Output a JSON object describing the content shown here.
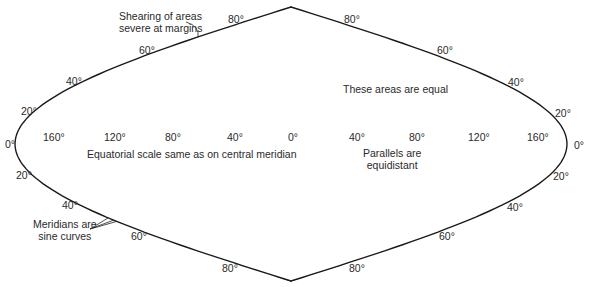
{
  "figure": {
    "projection": {
      "center_x": 291,
      "equator_y": 144,
      "half_width": 276,
      "half_height": 137
    },
    "colors": {
      "outline": "#1a1a1a",
      "grid": "#3a3a3a",
      "land": "#b4b4b4",
      "highlight_band": "#6e6e6e",
      "background": "#ffffff"
    }
  },
  "annotations": {
    "shearing_line1": "Shearing of areas",
    "shearing_line2": "severe at margins",
    "equal_areas": "These areas are equal",
    "equatorial_scale": "Equatorial scale same as on central meridian",
    "parallels_line1": "Parallels are",
    "parallels_line2": "equidistant",
    "meridians_line1": "Meridians are",
    "meridians_line2": "sine curves"
  },
  "labels": {
    "equator_left": "0°",
    "equator_right": "0°",
    "lon_160w": "160°",
    "lon_120w": "120°",
    "lon_80w": "80°",
    "lon_40w": "40°",
    "lon_0": "0°",
    "lon_40e": "40°",
    "lon_80e": "80°",
    "lon_120e": "120°",
    "lon_160e": "160°",
    "n80_left": "80°",
    "n80_right": "80°",
    "n60_left": "60°",
    "n60_right": "60°",
    "n40_left": "40°",
    "n40_right": "40°",
    "n20_left": "20°",
    "n20_right": "20°",
    "s20_left": "20°",
    "s20_right": "20°",
    "s40_left": "40°",
    "s40_right": "40°",
    "s60_left": "60°",
    "s60_right": "60°",
    "s80_left": "80°",
    "s80_right": "80°"
  }
}
